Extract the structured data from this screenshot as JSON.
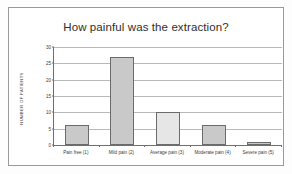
{
  "chart_data": {
    "type": "bar",
    "title": "How painful was the extraction?",
    "xlabel": "",
    "ylabel": "NUMBER OF PATIENTS",
    "categories": [
      "Pain free (1)",
      "Mild pain (2)",
      "Average pain (3)",
      "Moderate pain (4)",
      "Severe pain (5)"
    ],
    "values": [
      6,
      27,
      10,
      6,
      1
    ],
    "ylim": [
      0,
      30
    ],
    "ytick_values": [
      0,
      5,
      10,
      15,
      20,
      25,
      30
    ],
    "ytick_labels": [
      "0",
      "5",
      "10",
      "15",
      "20",
      "25",
      "30"
    ],
    "grid": true,
    "legend": false,
    "bar_color": "#c9c9c9",
    "bar_colors": [
      "#c9c9c9",
      "#c9c9c9",
      "#e6e6e6",
      "#c9c9c9",
      "#c9c9c9"
    ],
    "bar_edge_color": "#6b6b6b",
    "gridline_color": "#b9b9b9",
    "axis_color": "#6f6f6f",
    "text_color": "#3c3c3c",
    "background_color": "#ffffff",
    "frame_color": "#9a9a9a"
  }
}
